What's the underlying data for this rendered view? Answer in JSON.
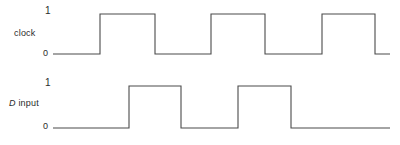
{
  "figure": {
    "type": "timing-diagram",
    "background_color": "#ffffff",
    "line_color": "#4a4a4a",
    "text_color": "#2b2b2b"
  },
  "signals": [
    {
      "name": "clock",
      "label_prefix": "",
      "label_text": "clock",
      "tick_high": "1",
      "tick_low": "0",
      "tick_high_x": 47,
      "tick_low_x": 47,
      "level_high_y": 14,
      "level_low_y": 54,
      "start_x": 53,
      "end_x": 390,
      "transitions": [
        100,
        155,
        211,
        265,
        322,
        375
      ],
      "start_level": 0,
      "path": "M 53 54 L 100 54 L 100 14 L 155 14 L 155 54 L 211 54 L 211 14 L 265 14 L 265 54 L 322 54 L 322 14 L 375 14 L 375 54 L 390 54"
    },
    {
      "name": "d-input",
      "label_prefix": "D",
      "label_text": " input",
      "tick_high": "1",
      "tick_low": "0",
      "tick_high_x": 47,
      "tick_low_x": 47,
      "level_high_y": 86,
      "level_low_y": 128,
      "start_x": 53,
      "end_x": 390,
      "transitions": [
        129,
        181,
        238,
        291
      ],
      "start_level": 0,
      "path": "M 53 128 L 129 128 L 129 86 L 181 86 L 181 128 L 238 128 L 238 86 L 291 86 L 291 128 L 390 128"
    }
  ],
  "chart_data": {
    "type": "line",
    "title": "",
    "xlabel": "",
    "ylabel": "",
    "series": [
      {
        "name": "clock",
        "levels": [
          0,
          1,
          0,
          1,
          0,
          1,
          0
        ],
        "edge_x": [
          53,
          100,
          155,
          211,
          265,
          322,
          375,
          390
        ]
      },
      {
        "name": "D input",
        "levels": [
          0,
          1,
          0,
          1,
          0
        ],
        "edge_x": [
          53,
          129,
          181,
          238,
          291,
          390
        ]
      }
    ],
    "ytick_labels": [
      "0",
      "1"
    ],
    "grid": false,
    "legend": "none"
  }
}
